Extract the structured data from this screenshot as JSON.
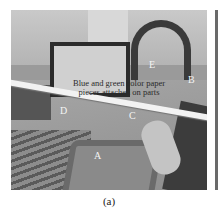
{
  "figure": {
    "annotation": "Blue and green color paper pieces attached on parts",
    "labels": {
      "A": "A",
      "B": "B",
      "C": "C",
      "D": "D",
      "E": "E"
    },
    "caption": "(a)"
  }
}
